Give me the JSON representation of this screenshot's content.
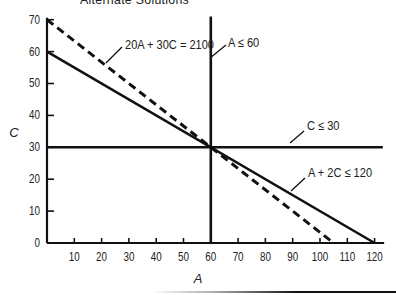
{
  "header": {
    "title": "Alternate Solutions"
  },
  "chart_data": {
    "type": "line",
    "title": "Alternate Solutions",
    "xlabel": "A",
    "ylabel": "C",
    "xlim": [
      0,
      120
    ],
    "ylim": [
      0,
      70
    ],
    "x_ticks": [
      10,
      20,
      30,
      40,
      50,
      60,
      70,
      80,
      90,
      100,
      110,
      120
    ],
    "y_ticks": [
      0,
      10,
      20,
      30,
      40,
      50,
      60,
      70
    ],
    "grid": false,
    "legend": "none (inline labels with leader lines)",
    "series": [
      {
        "name": "20A + 30C = 2100",
        "style": "dashed",
        "points": [
          [
            0,
            70
          ],
          [
            105,
            0
          ]
        ]
      },
      {
        "name": "A ≤ 60",
        "style": "solid",
        "points": [
          [
            60,
            0
          ],
          [
            60,
            71
          ]
        ]
      },
      {
        "name": "C ≤ 30",
        "style": "solid",
        "points": [
          [
            0,
            30
          ],
          [
            123,
            30
          ]
        ]
      },
      {
        "name": "A + 2C ≤ 120",
        "style": "solid",
        "points": [
          [
            0,
            60
          ],
          [
            120,
            0
          ]
        ]
      }
    ],
    "annotations": [
      {
        "text": "20A + 30C = 2100",
        "points_to": "dashed line"
      },
      {
        "text": "A ≤ 60",
        "points_to": "vertical line at A=60"
      },
      {
        "text": "C ≤ 30",
        "points_to": "horizontal line at C=30"
      },
      {
        "text": "A + 2C ≤ 120",
        "points_to": "solid diagonal line"
      }
    ],
    "intersection": [
      60,
      30
    ]
  },
  "colors": {
    "ink": "#111111",
    "background": "#ffffff"
  }
}
